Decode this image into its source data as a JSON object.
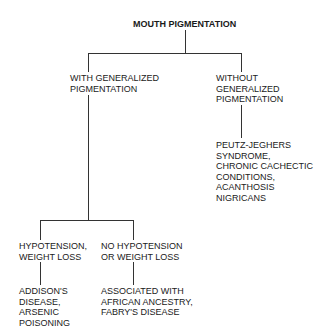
{
  "diagram": {
    "type": "decision-tree",
    "root": {
      "label": "MOUTH PIGMENTATION"
    },
    "level1": {
      "left": {
        "lines": [
          "WITH GENERALIZED",
          "PIGMENTATION"
        ]
      },
      "right": {
        "lines": [
          "WITHOUT",
          "GENERALIZED",
          "PIGMENTATION"
        ],
        "result": [
          "PEUTZ-JEGHERS",
          "SYNDROME,",
          "CHRONIC CACHECTIC",
          "CONDITIONS,",
          "ACANTHOSIS",
          "NIGRICANS"
        ]
      }
    },
    "level2": {
      "left": {
        "lines": [
          "HYPOTENSION,",
          "WEIGHT LOSS"
        ],
        "result": [
          "ADDISON'S",
          "DISEASE,",
          "ARSENIC",
          "POISONING"
        ]
      },
      "right": {
        "lines": [
          "NO HYPOTENSION",
          "OR WEIGHT LOSS"
        ],
        "result": [
          "ASSOCIATED WITH",
          "AFRICAN ANCESTRY,",
          "FABRY'S DISEASE"
        ]
      }
    },
    "line_color": "#333333",
    "text_color": "#1a1a1a"
  }
}
